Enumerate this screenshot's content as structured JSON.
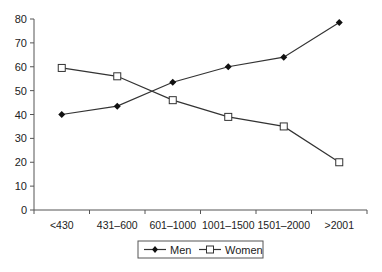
{
  "chart_data": {
    "type": "line",
    "title": "",
    "xlabel": "",
    "ylabel": "",
    "categories": [
      "<430",
      "431–600",
      "601–1000",
      "1001–1500",
      "1501–2000",
      ">2001"
    ],
    "series": [
      {
        "name": "Men",
        "marker": "filled-diamond",
        "values": [
          40,
          43.5,
          53.5,
          60,
          64,
          78.5
        ]
      },
      {
        "name": "Women",
        "marker": "open-square",
        "values": [
          59.5,
          56,
          46,
          39,
          35,
          20
        ]
      }
    ],
    "ylim": [
      0,
      80
    ],
    "yticks": [
      0,
      10,
      20,
      30,
      40,
      50,
      60,
      70,
      80
    ],
    "grid": false,
    "legend_position": "bottom"
  },
  "legend": {
    "items": [
      {
        "label": "Men"
      },
      {
        "label": "Women"
      }
    ]
  },
  "colors": {
    "line": "#333333",
    "axis": "#555555"
  }
}
